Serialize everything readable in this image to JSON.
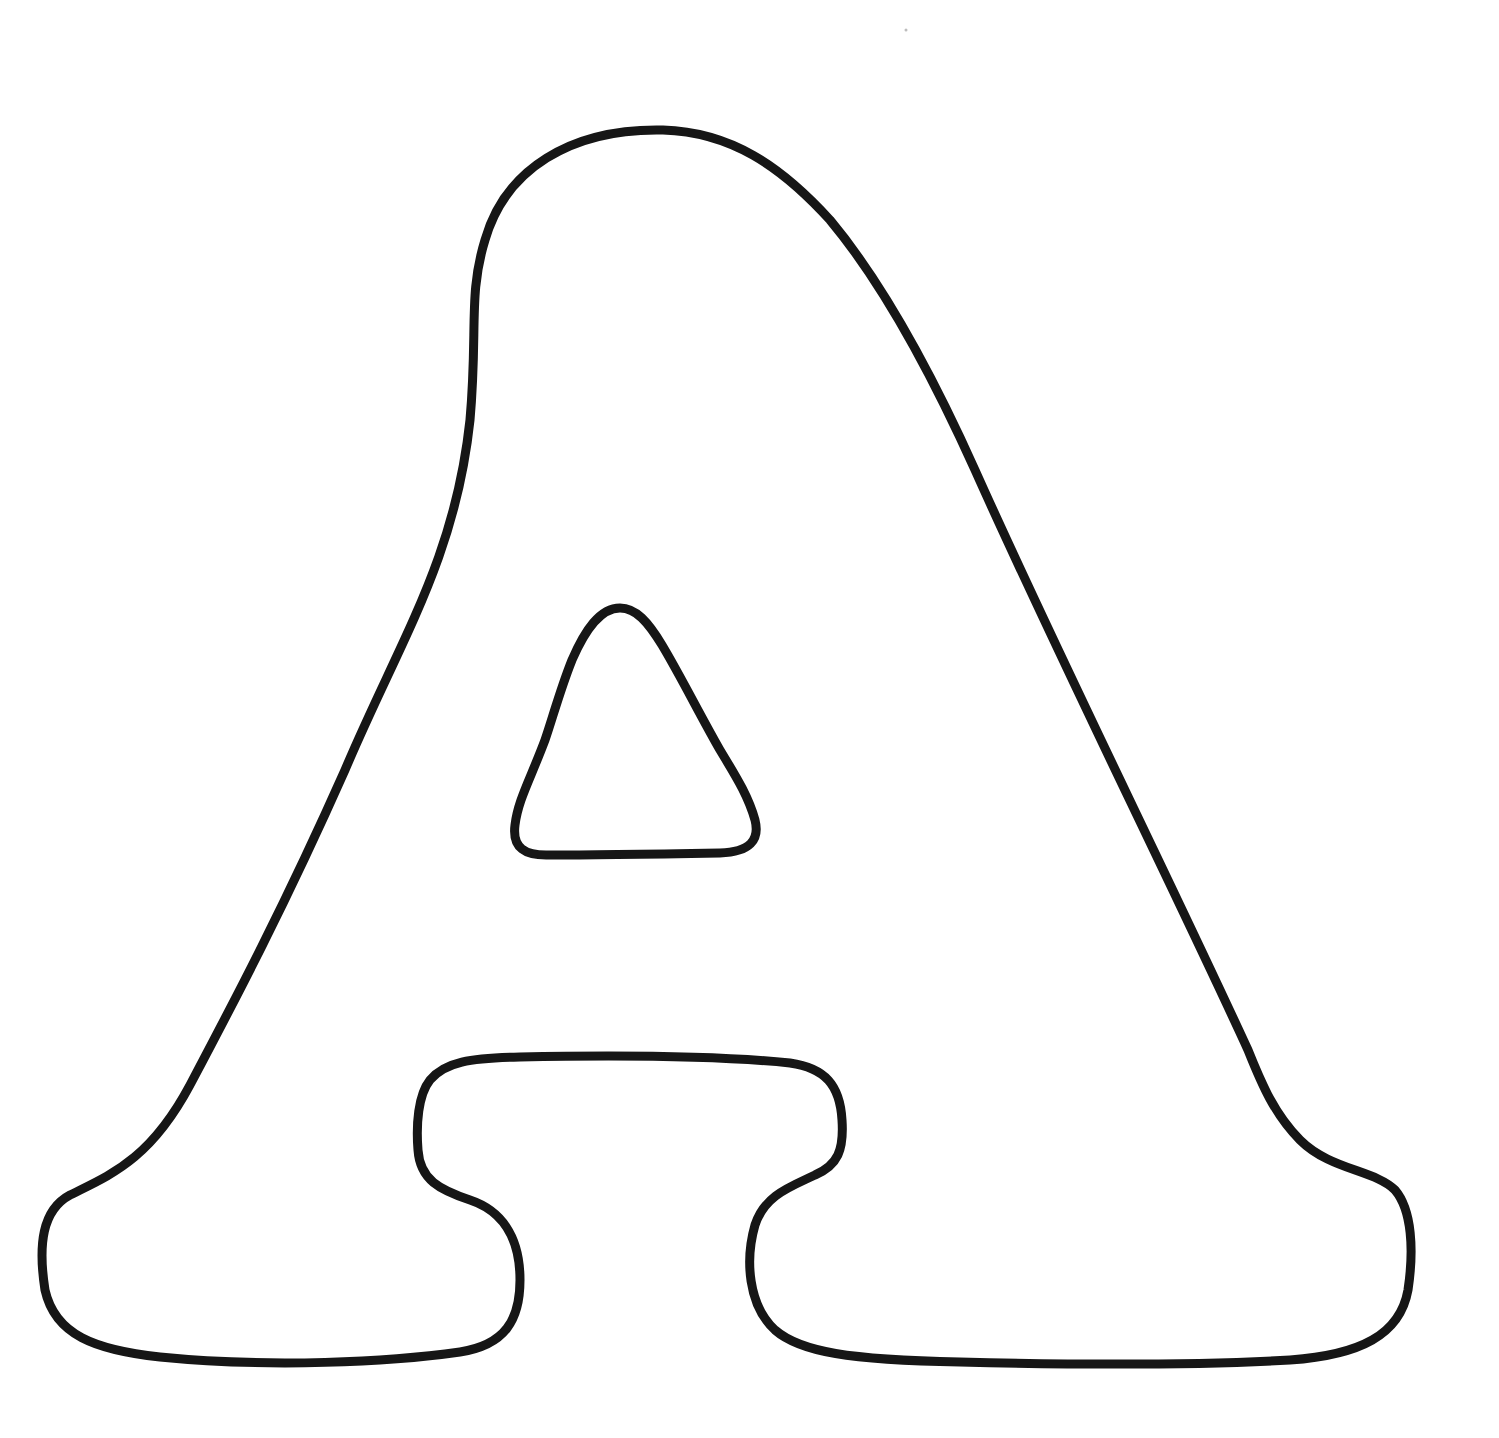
{
  "page": {
    "kind": "coloring-page",
    "letter": "A",
    "background_color": "#ffffff",
    "stroke_color": "#161616"
  },
  "shapes": [
    {
      "name": "letter-a-outer-outline",
      "description": "bubble letter A outer contour with two feet"
    },
    {
      "name": "letter-a-counter",
      "description": "rounded triangular inner hole"
    }
  ]
}
